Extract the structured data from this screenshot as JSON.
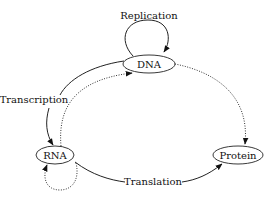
{
  "diagram": {
    "nodes": [
      {
        "id": "dna",
        "label": "DNA"
      },
      {
        "id": "rna",
        "label": "RNA"
      },
      {
        "id": "protein",
        "label": "Protein"
      }
    ],
    "edges": [
      {
        "from": "DNA",
        "to": "DNA",
        "label": "Replication",
        "style": "solid"
      },
      {
        "from": "DNA",
        "to": "RNA",
        "label": "Transcription",
        "style": "solid"
      },
      {
        "from": "RNA",
        "to": "Protein",
        "label": "Translation",
        "style": "solid"
      },
      {
        "from": "RNA",
        "to": "DNA",
        "label": "",
        "style": "dotted"
      },
      {
        "from": "RNA",
        "to": "RNA",
        "label": "",
        "style": "dotted"
      },
      {
        "from": "DNA",
        "to": "Protein",
        "label": "",
        "style": "dotted"
      }
    ],
    "labels": {
      "replication": "Replication",
      "transcription": "Transcription",
      "translation": "Translation"
    }
  }
}
